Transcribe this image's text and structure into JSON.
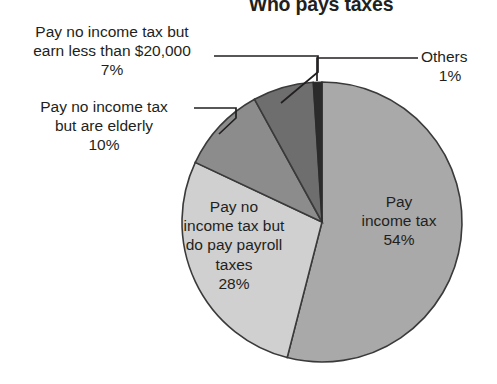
{
  "chart": {
    "title": "Who pays taxes"
  },
  "chart_data": {
    "type": "pie",
    "title": "Who pays taxes",
    "xlabel": "",
    "ylabel": "",
    "legend_position": "none",
    "grid": false,
    "units": "percent",
    "total": 100,
    "start_angle_deg": 0,
    "direction": "clockwise",
    "categories": [
      "Pay income tax",
      "Pay no income tax but do pay payroll taxes",
      "Pay no income tax but are elderly",
      "Pay no income tax but earn less than $20,000",
      "Others"
    ],
    "values": [
      54,
      28,
      10,
      7,
      1
    ],
    "slices": [
      {
        "name": "pay-income-tax",
        "label_lines": [
          "Pay",
          "income tax"
        ],
        "percent_text": "54%",
        "value": 54,
        "color": "#a9a9a9",
        "label_placement": "inside"
      },
      {
        "name": "pay-payroll-taxes",
        "label_lines": [
          "Pay no",
          "income tax but",
          "do pay payroll",
          "taxes"
        ],
        "percent_text": "28%",
        "value": 28,
        "color": "#d0d0d0",
        "label_placement": "inside"
      },
      {
        "name": "elderly",
        "label_lines": [
          "Pay no income tax",
          "but are elderly"
        ],
        "percent_text": "10%",
        "value": 10,
        "color": "#8c8c8c",
        "label_placement": "callout-left"
      },
      {
        "name": "earn-less-than-20000",
        "label_lines": [
          "Pay no income tax but",
          "earn less than $20,000"
        ],
        "percent_text": "7%",
        "value": 7,
        "color": "#6e6e6e",
        "label_placement": "callout-left"
      },
      {
        "name": "others",
        "label_lines": [
          "Others"
        ],
        "percent_text": "1%",
        "value": 1,
        "color": "#2b2b2b",
        "label_placement": "callout-right"
      }
    ],
    "colors": {
      "outline": "#3a3a3a",
      "leader_line": "#231f20",
      "text": "#231f20",
      "background": "#ffffff"
    }
  }
}
